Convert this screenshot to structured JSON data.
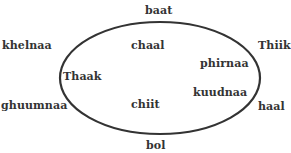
{
  "diagram": {
    "type": "set-ellipse",
    "stroke_color": "#333333",
    "text_color": "#333333",
    "inside_words": [
      {
        "label": "chaal",
        "x": 131,
        "y": 40
      },
      {
        "label": "phirnaa",
        "x": 200,
        "y": 58
      },
      {
        "label": "Thaak",
        "x": 63,
        "y": 71
      },
      {
        "label": "kuudnaa",
        "x": 193,
        "y": 87
      },
      {
        "label": "chiit",
        "x": 131,
        "y": 99
      }
    ],
    "outside_words": [
      {
        "label": "baat",
        "x": 145,
        "y": 5
      },
      {
        "label": "khelnaa",
        "x": 2,
        "y": 40
      },
      {
        "label": "Thiik",
        "x": 258,
        "y": 40
      },
      {
        "label": "ghuumnaa",
        "x": 1,
        "y": 100
      },
      {
        "label": "haal",
        "x": 258,
        "y": 101
      },
      {
        "label": "bol",
        "x": 146,
        "y": 140
      }
    ]
  }
}
